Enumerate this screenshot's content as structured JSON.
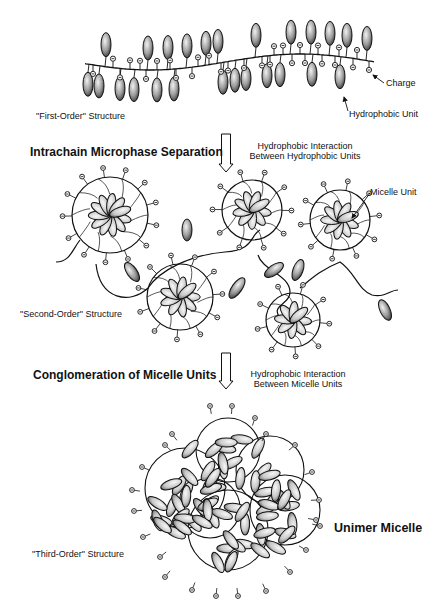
{
  "diagram": {
    "stages": [
      {
        "id": "first-order",
        "label": "\"First-Order\" Structure",
        "callouts": {
          "charge": "Charge",
          "hydrophobic_unit": "Hydrophobic Unit"
        }
      },
      {
        "id": "second-order",
        "label": "\"Second-Order\" Structure",
        "callouts": {
          "micelle_unit": "Micelle Unit"
        }
      },
      {
        "id": "third-order",
        "label": "\"Third-Order\" Structure",
        "callouts": {
          "unimer_micelle": "Unimer Micelle"
        }
      }
    ],
    "transitions": [
      {
        "process": "Intrachain Microphase Separation",
        "mechanism_line1": "Hydrophobic Interaction",
        "mechanism_line2": "Between Hydrophobic Units",
        "arrow": "down-arrow"
      },
      {
        "process": "Conglomeration of Micelle Units",
        "mechanism_line1": "Hydrophobic Interaction",
        "mechanism_line2": "Between Micelle Units",
        "arrow": "down-arrow"
      }
    ],
    "legend_glyphs": {
      "charge": "⊖",
      "hydrophobic_unit": "shaded ellipse"
    },
    "colors": {
      "line": "#111111",
      "ellipse_light": "#e6e6e6",
      "ellipse_dark": "#3a3a3a",
      "background": "#ffffff"
    }
  }
}
